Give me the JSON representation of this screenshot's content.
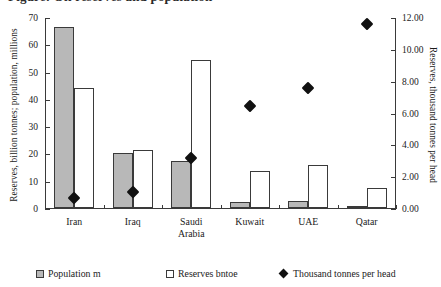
{
  "figure": {
    "clipped_title": "Figure: Oil reserves and population",
    "background": "#ffffff",
    "axis_color": "#3a3a3a"
  },
  "chart_data": {
    "type": "bar",
    "title": "",
    "xlabel": "",
    "ylabel": "Reserves, billion tonnes; population, millions",
    "y2label": "Reserves, thousand tonnes per head",
    "categories": [
      "Iran",
      "Iraq",
      "Saudi\nArabia",
      "Kuwait",
      "UAE",
      "Qatar"
    ],
    "ylim": [
      0,
      70
    ],
    "y2lim": [
      0,
      12
    ],
    "yticks": [
      "0",
      "10",
      "20",
      "30",
      "40",
      "50",
      "60",
      "70"
    ],
    "ytick_values": [
      0,
      10,
      20,
      30,
      40,
      50,
      60,
      70
    ],
    "y2ticks": [
      "0.00",
      "2.00",
      "4.00",
      "6.00",
      "8.00",
      "10.00",
      "12.00"
    ],
    "y2tick_values": [
      0,
      2,
      4,
      6,
      8,
      10,
      12
    ],
    "grid": false,
    "legend_position": "below",
    "series": [
      {
        "name": "Population m",
        "kind": "bar",
        "axis": "left",
        "color": "#b8b8b8",
        "edge": "#3a3a3a",
        "values": [
          66.3,
          20.0,
          17.4,
          2.3,
          2.5,
          0.8
        ]
      },
      {
        "name": "Reserves bntoe",
        "kind": "bar",
        "axis": "left",
        "color": "#ffffff",
        "edge": "#3a3a3a",
        "values": [
          44.0,
          21.2,
          54.4,
          13.4,
          15.8,
          7.4
        ]
      },
      {
        "name": "Thousand tonnes per head",
        "kind": "marker",
        "axis": "right",
        "color": "#111111",
        "marker": "diamond",
        "values": [
          0.69,
          1.05,
          3.2,
          6.45,
          7.6,
          11.65
        ]
      }
    ]
  },
  "legend": {
    "items": [
      {
        "label": "Population m",
        "icon": "gray-square-swatch"
      },
      {
        "label": "Reserves bntoe",
        "icon": "white-square-swatch"
      },
      {
        "label": "Thousand tonnes per head",
        "icon": "black-diamond-marker"
      }
    ]
  }
}
